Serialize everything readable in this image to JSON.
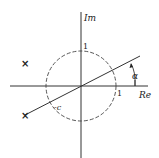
{
  "diagram": {
    "type": "complex-plane",
    "axes": {
      "real_label": "Re",
      "imag_label": "Im"
    },
    "unit_circle": {
      "style": "dashed",
      "tick_real_label": "1",
      "tick_imag_label": "1"
    },
    "line": {
      "angle_label": "α",
      "intersection_label": "-c"
    },
    "markers": [
      {
        "symbol": "×",
        "position": "upper-left"
      },
      {
        "symbol": "×",
        "position": "lower-left"
      }
    ],
    "colors": {
      "ink": "#222222",
      "background": "#ffffff"
    }
  }
}
